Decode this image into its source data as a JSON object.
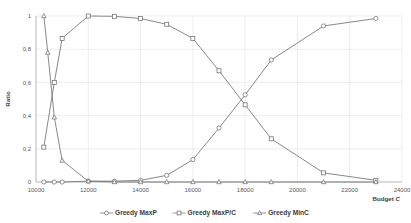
{
  "chart_data": {
    "type": "line",
    "title": "",
    "xlabel": "Budget C",
    "ylabel": "Ratio",
    "xlim": [
      10000,
      24000
    ],
    "ylim": [
      0,
      1
    ],
    "grid": true,
    "legend_position": "bottom",
    "xticks": [
      "10000",
      "12000",
      "14000",
      "16000",
      "18000",
      "20000",
      "22000",
      "24000"
    ],
    "xtick_values": [
      10000,
      12000,
      14000,
      16000,
      18000,
      20000,
      22000,
      24000
    ],
    "yticks": [
      "0",
      "0,2",
      "0,4",
      "0,6",
      "0,8",
      "1"
    ],
    "ytick_values": [
      0,
      0.2,
      0.4,
      0.6,
      0.8,
      1
    ],
    "series": [
      {
        "name": "Greedy MaxP",
        "marker": "circle",
        "color": "#6f6f71",
        "x": [
          10300,
          10700,
          11000,
          12000,
          13000,
          14000,
          15000,
          16000,
          17000,
          18000,
          19000,
          21000,
          23000
        ],
        "values": [
          0.0,
          0.0,
          0.0,
          0.005,
          0.005,
          0.01,
          0.04,
          0.135,
          0.325,
          0.525,
          0.735,
          0.94,
          0.985
        ]
      },
      {
        "name": "Greedy MaxP/C",
        "marker": "square",
        "color": "#6f6f71",
        "x": [
          10300,
          10700,
          11000,
          12000,
          13000,
          14000,
          15000,
          16000,
          17000,
          18000,
          19000,
          21000,
          23000
        ],
        "values": [
          0.21,
          0.6,
          0.865,
          1.0,
          0.998,
          0.985,
          0.95,
          0.865,
          0.67,
          0.465,
          0.26,
          0.055,
          0.01
        ]
      },
      {
        "name": "Greedy MinC",
        "marker": "triangle",
        "color": "#9a9a9c",
        "x": [
          10300,
          10700,
          11000,
          12000,
          13000,
          14000,
          15000,
          16000,
          17000,
          18000,
          19000,
          21000,
          23000
        ],
        "values": [
          1.0,
          0.39,
          0.13,
          0.005,
          0.0,
          0.0,
          0.0,
          0.0,
          0.0,
          0.0,
          0.0,
          0.0,
          0.0
        ]
      }
    ],
    "extra_points": [
      {
        "series": "Greedy MinC",
        "x": 10450,
        "y": 0.78
      }
    ]
  },
  "legend": {
    "items": [
      {
        "label": "Greedy MaxP",
        "marker": "circle"
      },
      {
        "label": "Greedy MaxP/C",
        "marker": "square"
      },
      {
        "label": "Greedy MinC",
        "marker": "triangle"
      }
    ]
  }
}
